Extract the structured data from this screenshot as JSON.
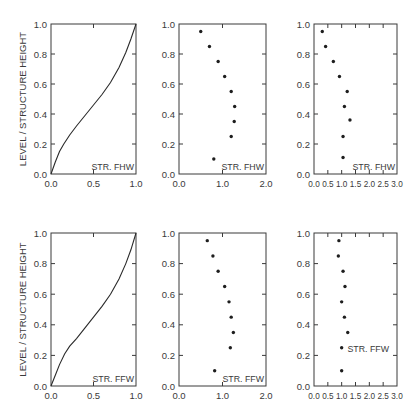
{
  "figure": {
    "background": "#ffffff",
    "ink": "#3a3a3a",
    "shared_ylabel": "LEVEL / STRUCTURE HEIGHT"
  },
  "chart_data": [
    {
      "id": "fhw-profile",
      "type": "line",
      "row": 0,
      "col": 0,
      "annotation": "STR. FHW",
      "ylabel": "LEVEL / STRUCTURE HEIGHT",
      "xlim": [
        0.0,
        1.0
      ],
      "ylim": [
        0.0,
        1.0
      ],
      "xticks": [
        0.0,
        0.5,
        1.0
      ],
      "xtick_labels": [
        "0.0",
        "0.5",
        "1.0"
      ],
      "yticks": [
        0.0,
        0.2,
        0.4,
        0.6,
        0.8,
        1.0
      ],
      "ytick_labels": [
        "0.0",
        "0.2",
        "0.4",
        "0.6",
        "0.8",
        "1.0"
      ],
      "grid": false,
      "x": [
        0.0,
        0.05,
        0.1,
        0.15,
        0.22,
        0.3,
        0.4,
        0.5,
        0.6,
        0.7,
        0.8,
        0.88,
        0.94,
        1.0
      ],
      "y": [
        0.0,
        0.08,
        0.15,
        0.2,
        0.26,
        0.32,
        0.39,
        0.46,
        0.53,
        0.61,
        0.71,
        0.81,
        0.9,
        1.0
      ]
    },
    {
      "id": "fhw-scatter-a",
      "type": "scatter",
      "row": 0,
      "col": 1,
      "annotation": "STR. FHW",
      "xlim": [
        0.0,
        2.0
      ],
      "ylim": [
        0.0,
        1.0
      ],
      "xticks": [
        0.0,
        1.0,
        2.0
      ],
      "xtick_labels": [
        "0.0",
        "1.0",
        "2.0"
      ],
      "yticks": [
        0.0,
        0.2,
        0.4,
        0.6,
        0.8,
        1.0
      ],
      "ytick_labels": [
        "0.0",
        "0.2",
        "0.4",
        "0.6",
        "0.8",
        "1.0"
      ],
      "grid": false,
      "x": [
        0.5,
        0.7,
        0.9,
        1.05,
        1.2,
        1.28,
        1.27,
        1.2,
        0.8
      ],
      "y": [
        0.95,
        0.85,
        0.75,
        0.65,
        0.55,
        0.45,
        0.35,
        0.25,
        0.1
      ]
    },
    {
      "id": "fhw-scatter-b",
      "type": "scatter",
      "row": 0,
      "col": 2,
      "annotation": "STR. FHW",
      "xlim": [
        0.0,
        3.0
      ],
      "ylim": [
        0.0,
        1.0
      ],
      "xticks": [
        0.0,
        0.5,
        1.0,
        1.5,
        2.0,
        2.5,
        3.0
      ],
      "xtick_labels": [
        "0.0",
        "0.5",
        "1.0",
        "1.5",
        "2.0",
        "2.5",
        "3.0"
      ],
      "yticks": [
        0.0,
        0.2,
        0.4,
        0.6,
        0.8,
        1.0
      ],
      "ytick_labels": [
        "0.0",
        "0.2",
        "0.4",
        "0.6",
        "0.8",
        "1.0"
      ],
      "grid": false,
      "x": [
        0.3,
        0.42,
        0.7,
        0.92,
        1.2,
        1.1,
        1.3,
        1.05,
        1.05
      ],
      "y": [
        0.95,
        0.85,
        0.75,
        0.65,
        0.55,
        0.45,
        0.36,
        0.25,
        0.11
      ]
    },
    {
      "id": "ffw-profile",
      "type": "line",
      "row": 1,
      "col": 0,
      "annotation": "STR. FFW",
      "ylabel": "LEVEL / STRUCTURE HEIGHT",
      "xlim": [
        0.0,
        1.0
      ],
      "ylim": [
        0.0,
        1.0
      ],
      "xticks": [
        0.0,
        0.5,
        1.0
      ],
      "xtick_labels": [
        "0.0",
        "0.5",
        "1.0"
      ],
      "yticks": [
        0.0,
        0.2,
        0.4,
        0.6,
        0.8,
        1.0
      ],
      "ytick_labels": [
        "0.0",
        "0.2",
        "0.4",
        "0.6",
        "0.8",
        "1.0"
      ],
      "grid": false,
      "x": [
        0.0,
        0.05,
        0.1,
        0.16,
        0.22,
        0.3,
        0.4,
        0.5,
        0.6,
        0.7,
        0.8,
        0.88,
        0.94,
        1.0
      ],
      "y": [
        0.0,
        0.07,
        0.14,
        0.21,
        0.26,
        0.31,
        0.38,
        0.45,
        0.52,
        0.6,
        0.7,
        0.8,
        0.89,
        1.0
      ]
    },
    {
      "id": "ffw-scatter-a",
      "type": "scatter",
      "row": 1,
      "col": 1,
      "annotation": "STR. FFW",
      "xlim": [
        0.0,
        2.0
      ],
      "ylim": [
        0.0,
        1.0
      ],
      "xticks": [
        0.0,
        1.0,
        2.0
      ],
      "xtick_labels": [
        "0.0",
        "1.0",
        "2.0"
      ],
      "yticks": [
        0.0,
        0.2,
        0.4,
        0.6,
        0.8,
        1.0
      ],
      "ytick_labels": [
        "0.0",
        "0.2",
        "0.4",
        "0.6",
        "0.8",
        "1.0"
      ],
      "grid": false,
      "x": [
        0.65,
        0.78,
        0.9,
        1.05,
        1.15,
        1.2,
        1.25,
        1.18,
        0.82
      ],
      "y": [
        0.95,
        0.85,
        0.75,
        0.65,
        0.55,
        0.45,
        0.35,
        0.25,
        0.1
      ]
    },
    {
      "id": "ffw-scatter-b",
      "type": "scatter",
      "row": 1,
      "col": 2,
      "annotation": "STR. FFW",
      "xlim": [
        0.0,
        3.0
      ],
      "ylim": [
        0.0,
        1.0
      ],
      "xticks": [
        0.0,
        0.5,
        1.0,
        1.5,
        2.0,
        2.5,
        3.0
      ],
      "xtick_labels": [
        "0.0",
        "0.5",
        "1.0",
        "1.5",
        "2.0",
        "2.5",
        "3.0"
      ],
      "yticks": [
        0.0,
        0.2,
        0.4,
        0.6,
        0.8,
        1.0
      ],
      "ytick_labels": [
        "0.0",
        "0.2",
        "0.4",
        "0.6",
        "0.8",
        "1.0"
      ],
      "grid": false,
      "x": [
        0.9,
        0.88,
        1.05,
        1.12,
        1.0,
        1.1,
        1.22,
        1.0,
        1.0
      ],
      "y": [
        0.95,
        0.85,
        0.75,
        0.65,
        0.55,
        0.45,
        0.35,
        0.25,
        0.1
      ]
    }
  ]
}
